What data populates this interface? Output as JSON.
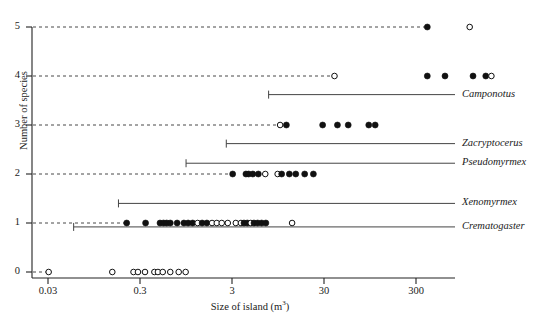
{
  "chart_data": {
    "type": "scatter",
    "title": "",
    "xlabel": "Size of island (m",
    "xlabel_sup": "3",
    "xlabel_tail": ")",
    "ylabel": "Number of species",
    "xscale": "log",
    "xlim": [
      0.012,
      1000
    ],
    "ylim": [
      0,
      5
    ],
    "xticks": [
      0.03,
      0.3,
      3,
      30,
      300
    ],
    "xtick_labels": [
      "0.03",
      "0.3",
      "3",
      "30",
      "300"
    ],
    "yticks": [
      0,
      1,
      2,
      3,
      4,
      5
    ],
    "ytick_labels": [
      "0",
      "1",
      "2",
      "3",
      "4",
      "5"
    ],
    "grid": "dashed horizontal guides from y-axis to first point of each level",
    "legend": "none",
    "marker_types": {
      "filled": "island occupied / species present (solid black circle)",
      "open": "island unoccupied (open circle)"
    },
    "series": [
      {
        "name": "Number of species per island",
        "marker": "circle",
        "points": [
          {
            "x": 398,
            "y": 5,
            "fill": "filled"
          },
          {
            "x": 1150,
            "y": 5,
            "fill": "open"
          },
          {
            "x": 39,
            "y": 4,
            "fill": "open"
          },
          {
            "x": 398,
            "y": 4,
            "fill": "filled"
          },
          {
            "x": 620,
            "y": 4,
            "fill": "filled"
          },
          {
            "x": 1250,
            "y": 4,
            "fill": "filled"
          },
          {
            "x": 1720,
            "y": 4,
            "fill": "filled"
          },
          {
            "x": 1980,
            "y": 4,
            "fill": "open"
          },
          {
            "x": 10.0,
            "y": 3,
            "fill": "open"
          },
          {
            "x": 11.7,
            "y": 3,
            "fill": "filled"
          },
          {
            "x": 29.0,
            "y": 3,
            "fill": "filled"
          },
          {
            "x": 42.0,
            "y": 3,
            "fill": "filled"
          },
          {
            "x": 55.0,
            "y": 3,
            "fill": "filled"
          },
          {
            "x": 92.0,
            "y": 3,
            "fill": "filled"
          },
          {
            "x": 108.0,
            "y": 3,
            "fill": "filled"
          },
          {
            "x": 3.05,
            "y": 2,
            "fill": "filled"
          },
          {
            "x": 4.25,
            "y": 2,
            "fill": "filled"
          },
          {
            "x": 4.55,
            "y": 2,
            "fill": "filled"
          },
          {
            "x": 5.05,
            "y": 2,
            "fill": "filled"
          },
          {
            "x": 5.8,
            "y": 2,
            "fill": "filled"
          },
          {
            "x": 6.9,
            "y": 2,
            "fill": "open"
          },
          {
            "x": 9.4,
            "y": 2,
            "fill": "open"
          },
          {
            "x": 10.4,
            "y": 2,
            "fill": "filled"
          },
          {
            "x": 12.6,
            "y": 2,
            "fill": "filled"
          },
          {
            "x": 14.8,
            "y": 2,
            "fill": "filled"
          },
          {
            "x": 18.5,
            "y": 2,
            "fill": "filled"
          },
          {
            "x": 23.0,
            "y": 2,
            "fill": "filled"
          },
          {
            "x": 0.215,
            "y": 1,
            "fill": "filled"
          },
          {
            "x": 0.345,
            "y": 1,
            "fill": "filled"
          },
          {
            "x": 0.495,
            "y": 1,
            "fill": "filled"
          },
          {
            "x": 0.54,
            "y": 1,
            "fill": "filled"
          },
          {
            "x": 0.585,
            "y": 1,
            "fill": "filled"
          },
          {
            "x": 0.64,
            "y": 1,
            "fill": "filled"
          },
          {
            "x": 0.76,
            "y": 1,
            "fill": "filled"
          },
          {
            "x": 0.9,
            "y": 1,
            "fill": "filled"
          },
          {
            "x": 1.0,
            "y": 1,
            "fill": "filled"
          },
          {
            "x": 1.12,
            "y": 1,
            "fill": "filled"
          },
          {
            "x": 1.27,
            "y": 1,
            "fill": "open"
          },
          {
            "x": 1.42,
            "y": 1,
            "fill": "filled"
          },
          {
            "x": 1.6,
            "y": 1,
            "fill": "filled"
          },
          {
            "x": 1.82,
            "y": 1,
            "fill": "open"
          },
          {
            "x": 2.05,
            "y": 1,
            "fill": "open"
          },
          {
            "x": 2.32,
            "y": 1,
            "fill": "open"
          },
          {
            "x": 2.7,
            "y": 1,
            "fill": "open"
          },
          {
            "x": 3.3,
            "y": 1,
            "fill": "open"
          },
          {
            "x": 3.75,
            "y": 1,
            "fill": "open"
          },
          {
            "x": 4.05,
            "y": 1,
            "fill": "filled"
          },
          {
            "x": 4.4,
            "y": 1,
            "fill": "filled"
          },
          {
            "x": 4.8,
            "y": 1,
            "fill": "open"
          },
          {
            "x": 5.2,
            "y": 1,
            "fill": "filled"
          },
          {
            "x": 5.7,
            "y": 1,
            "fill": "filled"
          },
          {
            "x": 6.3,
            "y": 1,
            "fill": "filled"
          },
          {
            "x": 7.0,
            "y": 1,
            "fill": "filled"
          },
          {
            "x": 13.5,
            "y": 1,
            "fill": "open"
          },
          {
            "x": 0.0305,
            "y": 0,
            "fill": "open"
          },
          {
            "x": 0.15,
            "y": 0,
            "fill": "open"
          },
          {
            "x": 0.255,
            "y": 0,
            "fill": "open"
          },
          {
            "x": 0.285,
            "y": 0,
            "fill": "open"
          },
          {
            "x": 0.34,
            "y": 0,
            "fill": "open"
          },
          {
            "x": 0.43,
            "y": 0,
            "fill": "open"
          },
          {
            "x": 0.47,
            "y": 0,
            "fill": "open"
          },
          {
            "x": 0.53,
            "y": 0,
            "fill": "open"
          },
          {
            "x": 0.64,
            "y": 0,
            "fill": "open"
          },
          {
            "x": 0.79,
            "y": 0,
            "fill": "open"
          },
          {
            "x": 0.94,
            "y": 0,
            "fill": "open"
          }
        ]
      }
    ],
    "range_bars": [
      {
        "genus": "Camponotus",
        "y_position": 3.62,
        "x_min": 7.5,
        "x_max": 1000,
        "has_left_tick": true
      },
      {
        "genus": "Zacryptocerus",
        "y_position": 2.62,
        "x_min": 2.6,
        "x_max": 1000,
        "has_left_tick": true
      },
      {
        "genus": "Pseudomyrmex",
        "y_position": 2.22,
        "x_min": 0.95,
        "x_max": 1000,
        "has_left_tick": true
      },
      {
        "genus": "Xenomyrmex",
        "y_position": 1.4,
        "x_min": 0.175,
        "x_max": 1000,
        "has_left_tick": true
      },
      {
        "genus": "Crematogaster",
        "y_position": 0.92,
        "x_min": 0.057,
        "x_max": 1000,
        "has_left_tick": true
      }
    ],
    "guide_lines": [
      {
        "y": 5,
        "x_end": 398
      },
      {
        "y": 4,
        "x_end": 39
      },
      {
        "y": 3,
        "x_end": 10.0
      },
      {
        "y": 2,
        "x_end": 3.05
      },
      {
        "y": 1,
        "x_end": 0.215
      },
      {
        "y": 0,
        "x_end": 0.0305
      }
    ],
    "colors": {
      "axis": "#222222",
      "marker_fill": "#111111",
      "marker_stroke": "#111111",
      "guide": "#333333",
      "range_bar": "#444444",
      "text": "#1a1a1a",
      "background": "#ffffff"
    }
  }
}
